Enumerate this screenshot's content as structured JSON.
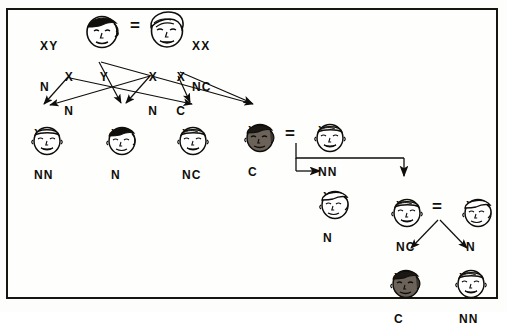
{
  "diagram": {
    "border_color": "#17150f",
    "background_color": "#fefefd",
    "ink_color": "#100e0a",
    "shaded_face_color": "#6b6259",
    "generations": [
      {
        "id": "P",
        "label": "parental-cross",
        "parents": [
          {
            "id": "p-father",
            "sex": "male",
            "affected": false,
            "genotype_top": "XY",
            "genotype_bottom": "N",
            "label_side": "left"
          },
          {
            "id": "p-mother",
            "sex": "female",
            "affected": false,
            "genotype_top": "XX",
            "genotype_bottom": "NC",
            "label_side": "right"
          }
        ],
        "cross_symbol": "=",
        "gametes": [
          {
            "id": "gam-f-x",
            "top": "X",
            "bottom": "N",
            "from": "p-father"
          },
          {
            "id": "gam-f-y",
            "top": "Y",
            "bottom": "",
            "from": "p-father"
          },
          {
            "id": "gam-m-xn",
            "top": "X",
            "bottom": "N",
            "from": "p-mother"
          },
          {
            "id": "gam-m-xc",
            "top": "X",
            "bottom": "C",
            "from": "p-mother"
          }
        ]
      },
      {
        "id": "F1",
        "label": "first-generation-offspring",
        "children": [
          {
            "id": "f1-child-1",
            "sex": "female",
            "affected": false,
            "genotype_top": "XX",
            "genotype_bottom": "NN"
          },
          {
            "id": "f1-child-2",
            "sex": "male",
            "affected": false,
            "genotype_top": "XY",
            "genotype_bottom": "N"
          },
          {
            "id": "f1-child-3",
            "sex": "female",
            "affected": false,
            "genotype_top": "XX",
            "genotype_bottom": "NC"
          },
          {
            "id": "f1-child-4",
            "sex": "male",
            "affected": true,
            "genotype_top": "XY",
            "genotype_bottom": "C"
          }
        ]
      },
      {
        "id": "F1-cross",
        "label": "second-cross",
        "parents": [
          {
            "id": "f1-affected-male",
            "sex": "male",
            "affected": true,
            "genotype_top": "XY",
            "genotype_bottom": "C"
          },
          {
            "id": "f1-cross-female",
            "sex": "female",
            "affected": false,
            "genotype_top": "XX",
            "genotype_bottom": "NN"
          }
        ],
        "cross_symbol": "="
      },
      {
        "id": "F2",
        "label": "second-generation-offspring",
        "children": [
          {
            "id": "f2-child-1",
            "sex": "male",
            "affected": false,
            "genotype_top": "XY",
            "genotype_bottom": "N"
          },
          {
            "id": "f2-child-2",
            "sex": "female",
            "affected": false,
            "genotype_top": "XX",
            "genotype_bottom": "NC"
          }
        ]
      },
      {
        "id": "F2-cross",
        "label": "third-cross",
        "parents": [
          {
            "id": "f2-carrier-female",
            "sex": "female",
            "affected": false,
            "genotype_top": "XX",
            "genotype_bottom": "NC"
          },
          {
            "id": "f2-cross-male",
            "sex": "male",
            "affected": false,
            "genotype_top": "XY",
            "genotype_bottom": "N"
          }
        ],
        "cross_symbol": "="
      },
      {
        "id": "F3",
        "label": "third-generation-offspring",
        "children": [
          {
            "id": "f3-child-1",
            "sex": "male",
            "affected": true,
            "genotype_top": "XY",
            "genotype_bottom": "C"
          },
          {
            "id": "f3-child-2",
            "sex": "female",
            "affected": false,
            "genotype_top": "XX",
            "genotype_bottom": "NN"
          }
        ]
      }
    ],
    "alleles": {
      "X": "X chromosome",
      "Y": "Y chromosome",
      "N": "normal allele",
      "C": "color-blind / affected allele"
    }
  }
}
